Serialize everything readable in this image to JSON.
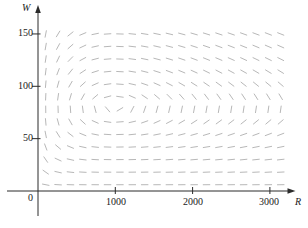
{
  "chart_data": {
    "type": "slope_field",
    "title": "",
    "xlabel": "R",
    "ylabel": "W",
    "xlim": [
      0,
      3300
    ],
    "ylim": [
      0,
      160
    ],
    "x_tick_values": [
      1000,
      2000,
      3000
    ],
    "x_tick_labels": [
      "1000",
      "2000",
      "3000"
    ],
    "y_tick_values": [
      150,
      100,
      50
    ],
    "y_tick_labels": [
      "150",
      "100",
      "50"
    ],
    "origin_label": "0",
    "grid": {
      "R_start": 100,
      "R_step": 160,
      "R_cols": 20,
      "W_start": 6,
      "W_step": 12,
      "W_rows": 13
    },
    "slope_model": {
      "equation": "dW/dR = (-0.02W + 0.00002RW) / (0.08R - 0.001RW)",
      "a": 0.08,
      "b": 0.001,
      "c": 0.02,
      "d": 2e-05,
      "equilibrium": {
        "R": 1000,
        "W": 80
      }
    },
    "dash_length_px": 7.4,
    "colors": {
      "axis": "#2b2b2b",
      "dash": "#afafaf",
      "label": "#1a1a1a"
    },
    "legend": "none",
    "gridlines": "off"
  }
}
